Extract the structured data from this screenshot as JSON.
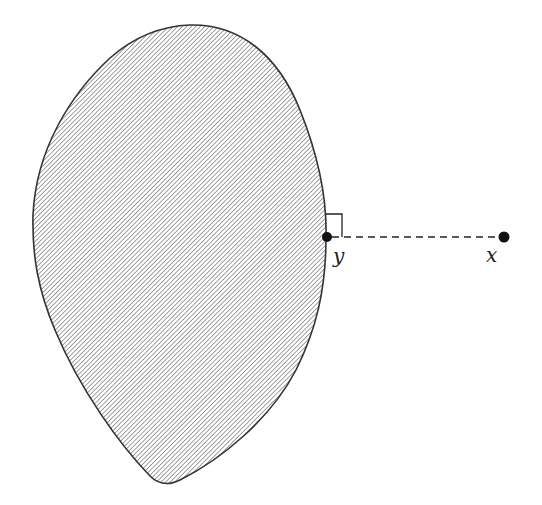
{
  "diagram": {
    "region": {
      "fill": "hatched",
      "hatch_color": "#8c8c8c",
      "outline_color": "#333333"
    },
    "points": [
      {
        "id": "y",
        "label": "y",
        "cx": 327,
        "cy": 237
      },
      {
        "id": "x",
        "label": "x",
        "cx": 504,
        "cy": 237
      }
    ],
    "segment": {
      "from": "y",
      "to": "x",
      "style": "dashed"
    },
    "right_angle_marker": true
  }
}
